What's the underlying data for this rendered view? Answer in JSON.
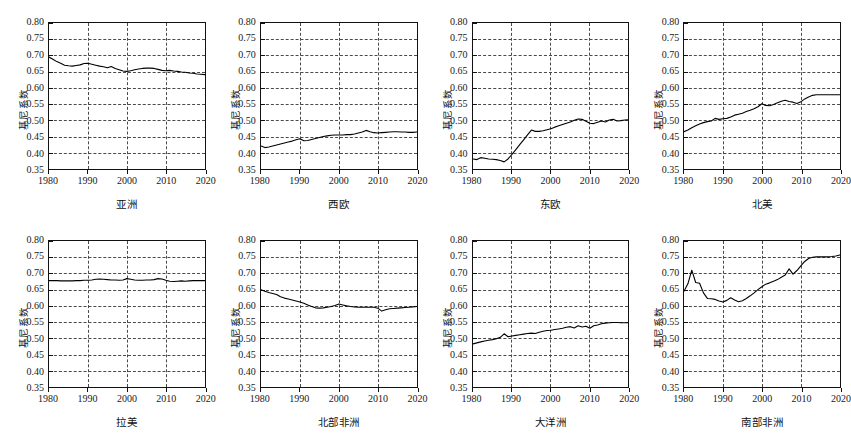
{
  "chart_data": {
    "type": "line",
    "title": "",
    "layout": {
      "rows": 2,
      "cols": 4,
      "grid": true,
      "legend": "none"
    },
    "shared": {
      "xlabel": "",
      "ylabel": "基尼系数",
      "xlim": [
        1980,
        2020
      ],
      "ylim": [
        0.35,
        0.8
      ],
      "xticks": [
        1980,
        1990,
        2000,
        2010,
        2020
      ],
      "xtick_labels": [
        "1980",
        "1990",
        "2000",
        "2010",
        "2020"
      ],
      "yticks": [
        0.35,
        0.4,
        0.45,
        0.5,
        0.55,
        0.6,
        0.65,
        0.7,
        0.75,
        0.8
      ],
      "ytick_labels": [
        "0.35",
        "0.40",
        "0.45",
        "0.50",
        "0.55",
        "0.60",
        "0.65",
        "0.70",
        "0.75",
        "0.80"
      ],
      "x": [
        1980,
        1981,
        1982,
        1983,
        1984,
        1985,
        1986,
        1987,
        1988,
        1989,
        1990,
        1991,
        1992,
        1993,
        1994,
        1995,
        1996,
        1997,
        1998,
        1999,
        2000,
        2001,
        2002,
        2003,
        2004,
        2005,
        2006,
        2007,
        2008,
        2009,
        2010,
        2011,
        2012,
        2013,
        2014,
        2015,
        2016,
        2017,
        2018,
        2019,
        2020
      ],
      "line_color": "#000000",
      "grid_color": "#4a4a4a",
      "grid_style": "dashed"
    },
    "panels": [
      {
        "name": "asia",
        "label": "亚洲",
        "ylabel": "基尼系数",
        "values": [
          0.695,
          0.688,
          0.681,
          0.676,
          0.67,
          0.668,
          0.667,
          0.669,
          0.671,
          0.675,
          0.676,
          0.673,
          0.67,
          0.667,
          0.665,
          0.662,
          0.666,
          0.66,
          0.656,
          0.652,
          0.651,
          0.653,
          0.656,
          0.658,
          0.66,
          0.661,
          0.661,
          0.66,
          0.657,
          0.654,
          0.653,
          0.654,
          0.652,
          0.651,
          0.649,
          0.648,
          0.646,
          0.645,
          0.643,
          0.642,
          0.641
        ]
      },
      {
        "name": "western-europe",
        "label": "西欧",
        "ylabel": "基尼系数",
        "values": [
          0.421,
          0.416,
          0.418,
          0.421,
          0.424,
          0.427,
          0.43,
          0.433,
          0.436,
          0.44,
          0.443,
          0.437,
          0.438,
          0.441,
          0.444,
          0.447,
          0.45,
          0.452,
          0.454,
          0.455,
          0.455,
          0.455,
          0.456,
          0.456,
          0.458,
          0.461,
          0.464,
          0.469,
          0.465,
          0.462,
          0.461,
          0.462,
          0.463,
          0.464,
          0.465,
          0.465,
          0.464,
          0.464,
          0.463,
          0.463,
          0.464
        ]
      },
      {
        "name": "eastern-europe",
        "label": "东欧",
        "ylabel": "基尼系数",
        "values": [
          0.381,
          0.379,
          0.385,
          0.383,
          0.381,
          0.38,
          0.379,
          0.376,
          0.372,
          0.381,
          0.395,
          0.41,
          0.425,
          0.44,
          0.455,
          0.47,
          0.466,
          0.466,
          0.468,
          0.471,
          0.474,
          0.479,
          0.483,
          0.487,
          0.491,
          0.495,
          0.5,
          0.504,
          0.503,
          0.497,
          0.491,
          0.49,
          0.494,
          0.498,
          0.495,
          0.501,
          0.503,
          0.498,
          0.499,
          0.501,
          0.502
        ]
      },
      {
        "name": "north-america",
        "label": "北美",
        "ylabel": "基尼系数",
        "values": [
          0.465,
          0.47,
          0.477,
          0.483,
          0.489,
          0.493,
          0.496,
          0.498,
          0.506,
          0.503,
          0.505,
          0.506,
          0.51,
          0.516,
          0.519,
          0.522,
          0.527,
          0.531,
          0.536,
          0.542,
          0.551,
          0.546,
          0.545,
          0.549,
          0.554,
          0.559,
          0.562,
          0.558,
          0.556,
          0.552,
          0.557,
          0.566,
          0.572,
          0.577,
          0.579,
          0.579,
          0.579,
          0.579,
          0.579,
          0.579,
          0.579
        ]
      },
      {
        "name": "latin-america",
        "label": "拉美",
        "ylabel": "基尼系数",
        "values": [
          0.678,
          0.678,
          0.678,
          0.677,
          0.677,
          0.677,
          0.677,
          0.678,
          0.678,
          0.679,
          0.679,
          0.68,
          0.682,
          0.683,
          0.682,
          0.681,
          0.68,
          0.68,
          0.679,
          0.68,
          0.684,
          0.682,
          0.68,
          0.679,
          0.679,
          0.68,
          0.68,
          0.681,
          0.684,
          0.683,
          0.679,
          0.676,
          0.675,
          0.676,
          0.677,
          0.676,
          0.677,
          0.678,
          0.678,
          0.678,
          0.678
        ]
      },
      {
        "name": "north-africa",
        "label": "北部非洲",
        "ylabel": "基尼系数",
        "values": [
          0.65,
          0.645,
          0.641,
          0.638,
          0.635,
          0.628,
          0.624,
          0.621,
          0.618,
          0.615,
          0.612,
          0.608,
          0.603,
          0.598,
          0.594,
          0.593,
          0.594,
          0.596,
          0.598,
          0.601,
          0.606,
          0.603,
          0.6,
          0.598,
          0.597,
          0.596,
          0.596,
          0.596,
          0.596,
          0.596,
          0.593,
          0.584,
          0.588,
          0.591,
          0.592,
          0.593,
          0.594,
          0.595,
          0.596,
          0.597,
          0.598
        ]
      },
      {
        "name": "oceania",
        "label": "大洋洲",
        "ylabel": "基尼系数",
        "values": [
          0.483,
          0.486,
          0.489,
          0.492,
          0.494,
          0.496,
          0.499,
          0.503,
          0.514,
          0.505,
          0.507,
          0.509,
          0.511,
          0.513,
          0.515,
          0.516,
          0.515,
          0.519,
          0.522,
          0.524,
          0.525,
          0.527,
          0.529,
          0.531,
          0.534,
          0.536,
          0.532,
          0.539,
          0.535,
          0.537,
          0.531,
          0.539,
          0.541,
          0.545,
          0.547,
          0.548,
          0.549,
          0.549,
          0.548,
          0.548,
          0.548
        ]
      },
      {
        "name": "southern-africa",
        "label": "南部非洲",
        "ylabel": "基尼系数",
        "values": [
          0.645,
          0.668,
          0.71,
          0.672,
          0.67,
          0.64,
          0.623,
          0.622,
          0.62,
          0.615,
          0.612,
          0.617,
          0.625,
          0.618,
          0.613,
          0.616,
          0.623,
          0.631,
          0.64,
          0.65,
          0.659,
          0.667,
          0.671,
          0.676,
          0.681,
          0.688,
          0.695,
          0.714,
          0.698,
          0.709,
          0.723,
          0.737,
          0.746,
          0.75,
          0.751,
          0.751,
          0.751,
          0.751,
          0.752,
          0.754,
          0.757
        ]
      }
    ]
  }
}
